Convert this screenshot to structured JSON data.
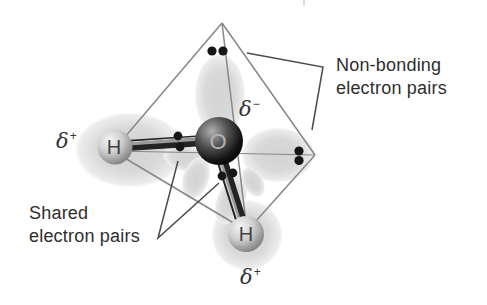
{
  "labels": {
    "non_bonding": {
      "line1": "Non-bonding",
      "line2": "electron pairs"
    },
    "shared": {
      "line1": "Shared",
      "line2": "electron pairs"
    }
  },
  "atoms": {
    "oxygen": {
      "symbol": "O",
      "charge": {
        "base": "δ",
        "sign": "−"
      }
    },
    "hydrogen_left": {
      "symbol": "H",
      "charge": {
        "base": "δ",
        "sign": "+"
      }
    },
    "hydrogen_bottom": {
      "symbol": "H",
      "charge": {
        "base": "δ",
        "sign": "+"
      }
    }
  },
  "electron_pairs": {
    "non_bonding_pairs": 2,
    "shared_pairs": 2,
    "electrons_per_pair": 2
  },
  "colors": {
    "background": "#ffffff",
    "text": "#2e2e2e",
    "tetrahedron_line": "#878787",
    "pointer_line": "#4a4a4a",
    "electron_dot": "#161616",
    "bond_dark": "#232323",
    "lobe_gray": "#d7d7d7",
    "oxygen_dark": "#0a0a0a",
    "hydrogen_gray": "#9e9e9e"
  }
}
